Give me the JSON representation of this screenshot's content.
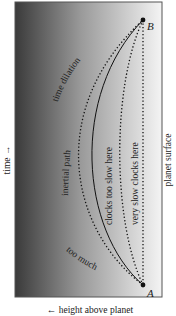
{
  "figure": {
    "axes": {
      "time_label": "time →",
      "height_label": "← height above planet",
      "surface_label": "planet surface"
    },
    "points": {
      "start": "A",
      "end": "B"
    },
    "paths": {
      "time_dilation": "time dilation",
      "too_much": "too much",
      "inertial": "inertial path",
      "clocks_too_slow": "clocks too slow here",
      "very_slow": "very slow clocks here"
    },
    "colors": {
      "gradient_dark": "#3a3a3a",
      "gradient_light": "#f2f2f2",
      "frame": "#555555",
      "ink": "#111111"
    }
  }
}
